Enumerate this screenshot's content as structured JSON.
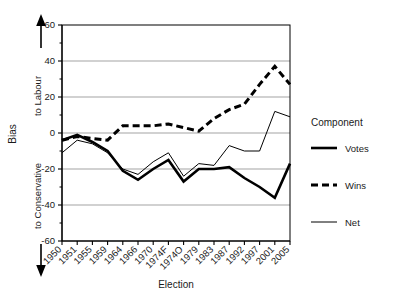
{
  "chart_data": {
    "type": "line",
    "title": "",
    "xlabel": "Election",
    "ylabel": "Bias",
    "ylim": [
      -60,
      60
    ],
    "yticks": [
      -60,
      -40,
      -20,
      0,
      20,
      40,
      60
    ],
    "ytick_labels": [
      "-60",
      "-40",
      "-20",
      "0",
      "20",
      "40",
      "60"
    ],
    "minor_ytick_step": 10,
    "grid": "horizontal-major",
    "legend_position": "right",
    "legend_title": "Component",
    "axis_direction_labels": {
      "up": "to Labour",
      "down": "to Conservative",
      "up_arrow": "arrow-up",
      "down_arrow": "arrow-down"
    },
    "categories": [
      "1950",
      "1951",
      "1955",
      "1959",
      "1964",
      "1966",
      "1970",
      "1974F",
      "1974O",
      "1979",
      "1983",
      "1987",
      "1992",
      "1997",
      "2001",
      "2005"
    ],
    "series": [
      {
        "name": "Votes",
        "style": "thick-solid",
        "color": "#000000",
        "values": [
          -4,
          -1,
          -5,
          -10,
          -21,
          -26,
          -20,
          -15,
          -27,
          -20,
          -20,
          -19,
          -25,
          -30,
          -36,
          -17
        ]
      },
      {
        "name": "Wins",
        "style": "thick-dashed",
        "color": "#000000",
        "values": [
          -4,
          -2,
          -3,
          -4,
          4,
          4,
          4,
          5,
          3,
          1,
          8,
          13,
          16,
          27,
          37,
          27
        ]
      },
      {
        "name": "Net",
        "style": "thin-solid",
        "color": "#000000",
        "values": [
          -11,
          -4,
          -6,
          -11,
          -20,
          -23,
          -16,
          -11,
          -24,
          -17,
          -18,
          -7,
          -10,
          -10,
          12,
          9
        ]
      }
    ]
  },
  "legend": {
    "title": "Component",
    "entries": [
      {
        "label": "Votes",
        "swatch": "thick-solid-line-swatch"
      },
      {
        "label": "Wins",
        "swatch": "thick-dashed-line-swatch"
      },
      {
        "label": "Net",
        "swatch": "thin-solid-line-swatch"
      }
    ]
  },
  "axes": {
    "y_title": "Bias",
    "y_up_label": "to Labour",
    "y_down_label": "to Conservative",
    "x_title": "Election"
  }
}
